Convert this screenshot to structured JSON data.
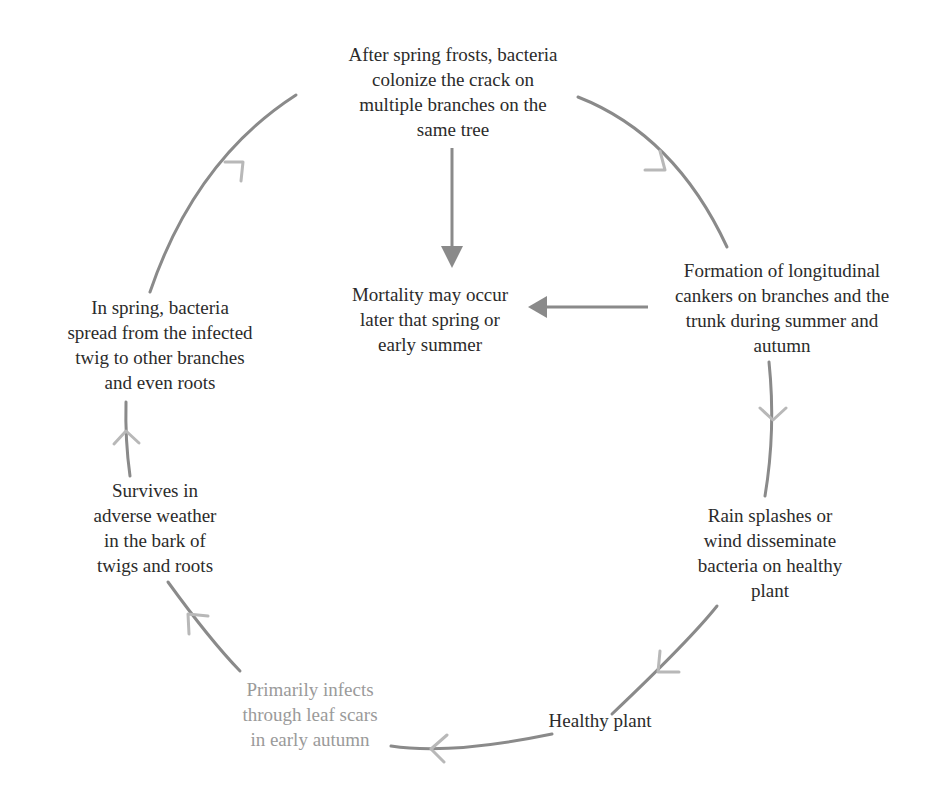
{
  "diagram": {
    "type": "disease-cycle",
    "colors": {
      "line": "#8a8a8a",
      "chevron": "#b8b8b8",
      "text": "#2b2b2b",
      "faded_text": "#9a9a9a"
    },
    "nodes": [
      {
        "id": "spring-frosts",
        "text": "After spring frosts, bacteria\ncolonize the crack on\nmultiple branches on the\nsame tree"
      },
      {
        "id": "canker-formation",
        "text": "Formation of longitudinal\ncankers on branches and the\ntrunk during summer and\nautumn"
      },
      {
        "id": "dissemination",
        "text": "Rain splashes or\nwind disseminate\nbacteria on healthy\nplant"
      },
      {
        "id": "healthy-plant",
        "text": "Healthy plant"
      },
      {
        "id": "primary-infection",
        "text": "Primarily infects\nthrough leaf scars\nin early autumn"
      },
      {
        "id": "survival",
        "text": "Survives in\nadverse weather\nin the bark of\ntwigs and roots"
      },
      {
        "id": "spring-spread",
        "text": "In spring, bacteria\nspread from the infected\ntwig to other branches\nand even roots"
      },
      {
        "id": "mortality",
        "text": "Mortality may occur\nlater that spring or\nearly summer"
      }
    ],
    "edges": [
      {
        "from": "spring-frosts",
        "to": "canker-formation",
        "style": "cycle"
      },
      {
        "from": "canker-formation",
        "to": "dissemination",
        "style": "cycle"
      },
      {
        "from": "dissemination",
        "to": "healthy-plant",
        "style": "cycle"
      },
      {
        "from": "healthy-plant",
        "to": "primary-infection",
        "style": "cycle"
      },
      {
        "from": "primary-infection",
        "to": "survival",
        "style": "cycle"
      },
      {
        "from": "survival",
        "to": "spring-spread",
        "style": "cycle"
      },
      {
        "from": "spring-spread",
        "to": "spring-frosts",
        "style": "cycle"
      },
      {
        "from": "spring-frosts",
        "to": "mortality",
        "style": "solid"
      },
      {
        "from": "canker-formation",
        "to": "mortality",
        "style": "solid"
      }
    ]
  }
}
